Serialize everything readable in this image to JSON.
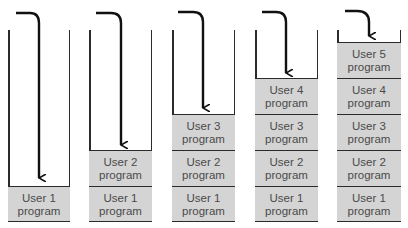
{
  "diagram": {
    "block_color": "#d4d4d4",
    "line_color": "#2b2b2b",
    "text_color": "#4a4a4a",
    "columns": [
      {
        "blocks": [
          {
            "line1": "User 1",
            "line2": "program"
          }
        ]
      },
      {
        "blocks": [
          {
            "line1": "User 1",
            "line2": "program"
          },
          {
            "line1": "User 2",
            "line2": "program"
          }
        ]
      },
      {
        "blocks": [
          {
            "line1": "User 1",
            "line2": "program"
          },
          {
            "line1": "User 2",
            "line2": "program"
          },
          {
            "line1": "User 3",
            "line2": "program"
          }
        ]
      },
      {
        "blocks": [
          {
            "line1": "User 1",
            "line2": "program"
          },
          {
            "line1": "User 2",
            "line2": "program"
          },
          {
            "line1": "User 3",
            "line2": "program"
          },
          {
            "line1": "User 4",
            "line2": "program"
          }
        ]
      },
      {
        "blocks": [
          {
            "line1": "User 1",
            "line2": "program"
          },
          {
            "line1": "User 2",
            "line2": "program"
          },
          {
            "line1": "User 3",
            "line2": "program"
          },
          {
            "line1": "User 4",
            "line2": "program"
          },
          {
            "line1": "User 5",
            "line2": "program"
          }
        ]
      }
    ]
  }
}
